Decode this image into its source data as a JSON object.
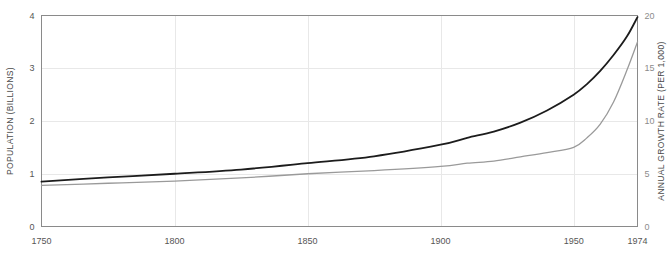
{
  "chart_data": {
    "type": "line",
    "title": "",
    "subtitle": "",
    "xlabel": "",
    "ylabel": "POPULATION (BILLIONS)",
    "y2label": "ANNUAL GROWTH RATE (PER 1,000)",
    "grid": true,
    "legend": "none",
    "xlim": [
      1750,
      1974
    ],
    "ylim": [
      0,
      4
    ],
    "y2lim": [
      0,
      20
    ],
    "xticks": [
      1750,
      1800,
      1850,
      1900,
      1950,
      1974
    ],
    "xticklabels": [
      "1750",
      "1800",
      "1850",
      "1900",
      "1950",
      "1974"
    ],
    "yticks": [
      0,
      1,
      2,
      3,
      4
    ],
    "yticklabels": [
      "0",
      "1",
      "2",
      "3",
      "4"
    ],
    "y2ticks": [
      0,
      5,
      10,
      15,
      20
    ],
    "y2ticklabels": [
      "0",
      "5",
      "10",
      "15",
      "20"
    ],
    "series": [
      {
        "name": "Population",
        "axis": "left",
        "color": "#1c1c1c",
        "width": 1.8,
        "x": [
          1750,
          1775,
          1800,
          1825,
          1850,
          1875,
          1900,
          1910,
          1920,
          1930,
          1940,
          1950,
          1955,
          1960,
          1965,
          1970,
          1974
        ],
        "values": [
          0.85,
          0.93,
          1.0,
          1.08,
          1.2,
          1.33,
          1.55,
          1.68,
          1.8,
          1.97,
          2.2,
          2.5,
          2.7,
          2.95,
          3.25,
          3.6,
          3.97
        ]
      },
      {
        "name": "Annual growth rate",
        "axis": "right",
        "color": "#9a9a9a",
        "width": 1.3,
        "x": [
          1750,
          1775,
          1800,
          1825,
          1850,
          1875,
          1900,
          1910,
          1920,
          1930,
          1940,
          1950,
          1955,
          1960,
          1965,
          1970,
          1974
        ],
        "values": [
          3.9,
          4.1,
          4.3,
          4.6,
          5.0,
          5.3,
          5.7,
          6.0,
          6.2,
          6.6,
          7.0,
          7.5,
          8.4,
          9.7,
          11.8,
          14.8,
          17.5
        ]
      }
    ]
  },
  "axes": {
    "left_title": "POPULATION (BILLIONS)",
    "right_title": "ANNUAL GROWTH RATE (PER 1,000)"
  },
  "colors": {
    "population_line": "#1c1c1c",
    "growth_line": "#9a9a9a",
    "grid": "#e8e8e8",
    "axis": "#8a8a8a",
    "tick_text": "#555555",
    "tick_text_right": "#8c8c8c"
  }
}
